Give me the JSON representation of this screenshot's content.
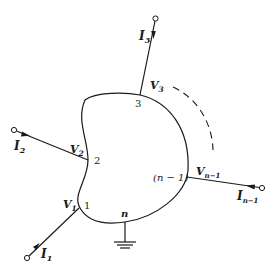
{
  "diagram": {
    "stroke_color": "#1a1a1a",
    "background": "#ffffff",
    "nodes": [
      {
        "id": "1",
        "label": "1",
        "voltage": "V",
        "voltage_sub": "1",
        "current": "I",
        "current_sub": "1"
      },
      {
        "id": "2",
        "label": "2",
        "voltage": "V",
        "voltage_sub": "2",
        "current": "I",
        "current_sub": "2"
      },
      {
        "id": "3",
        "label": "3",
        "voltage": "V",
        "voltage_sub": "3",
        "current": "I",
        "current_sub": "3"
      },
      {
        "id": "n-1",
        "label": "(n − 1)",
        "voltage": "V",
        "voltage_sub": "n−1",
        "current": "I",
        "current_sub": "n−1"
      },
      {
        "id": "n",
        "label": "n",
        "ground": true
      }
    ],
    "continuation": "dashed-arc"
  }
}
